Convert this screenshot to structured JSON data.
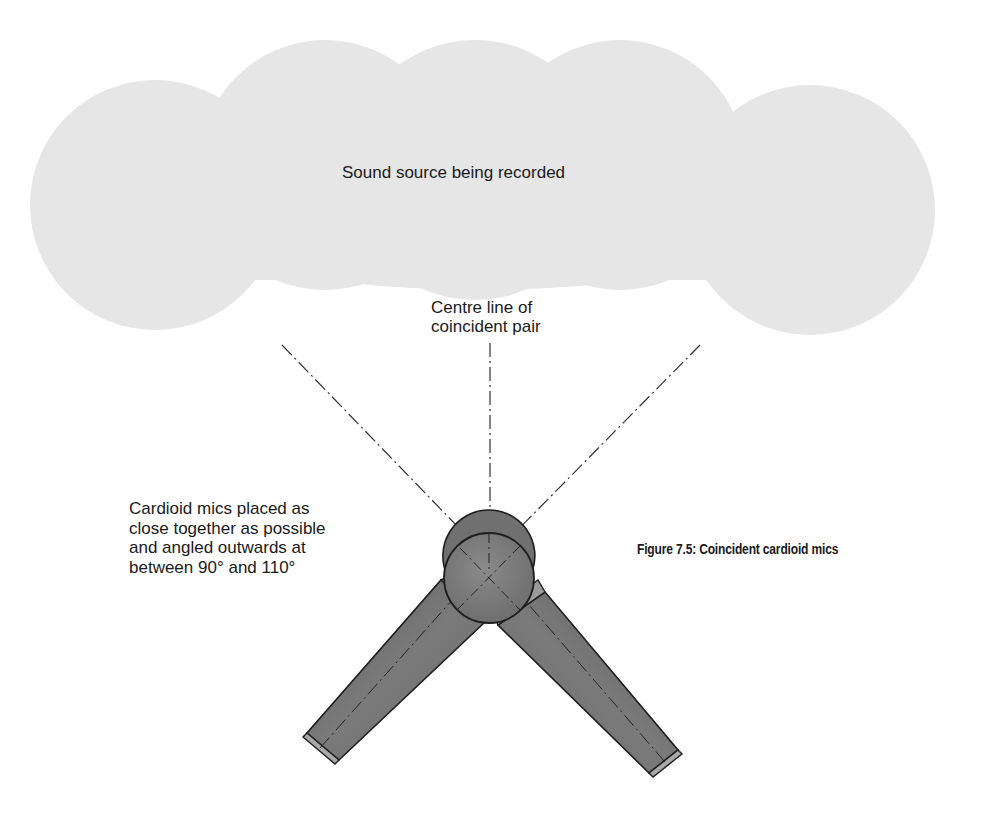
{
  "figure": {
    "caption": "Figure 7.5: Coincident cardioid mics"
  },
  "cloud": {
    "label": "Sound source being recorded",
    "fill_color": "#e6e6e6"
  },
  "centre_line": {
    "label_lines": [
      "Centre line of",
      "coincident pair"
    ]
  },
  "mics": {
    "label_lines": [
      "Cardioid mics placed as",
      "close together as possible",
      "and angled outwards at",
      "between 90° and 110°"
    ],
    "body_color": "#6e6e6e",
    "head_color": "#7a7a7a",
    "outline_color": "#1e1e1e"
  },
  "axis_lines": {
    "style": "dash-dot",
    "color": "#333333"
  }
}
